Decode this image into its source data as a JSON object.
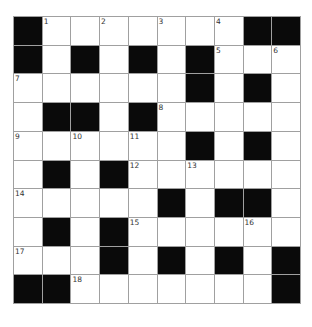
{
  "puzzle": {
    "rows": 10,
    "cols": 10,
    "colors": {
      "black": "#0a0a0a",
      "white": "#ffffff",
      "grid_line": "#a0a0a0",
      "number": "#333333"
    },
    "grid": [
      [
        "B",
        "1",
        ".",
        "2",
        ".",
        "3",
        ".",
        "4",
        "B",
        "B"
      ],
      [
        "B",
        ".",
        "B",
        ".",
        "B",
        ".",
        "B",
        "5",
        ".",
        "6"
      ],
      [
        "7",
        ".",
        ".",
        ".",
        ".",
        ".",
        "B",
        ".",
        "B",
        "."
      ],
      [
        ".",
        "B",
        "B",
        ".",
        "B",
        "8",
        ".",
        ".",
        ".",
        "."
      ],
      [
        "9",
        ".",
        "10",
        ".",
        "11",
        ".",
        "B",
        ".",
        "B",
        "."
      ],
      [
        ".",
        "B",
        ".",
        "B",
        "12",
        ".",
        "13",
        ".",
        ".",
        "."
      ],
      [
        "14",
        ".",
        ".",
        ".",
        ".",
        "B",
        ".",
        "B",
        "B",
        "."
      ],
      [
        ".",
        "B",
        ".",
        "B",
        "15",
        ".",
        ".",
        ".",
        "16",
        "."
      ],
      [
        "17",
        ".",
        ".",
        "B",
        ".",
        "B",
        ".",
        "B",
        ".",
        "B"
      ],
      [
        "B",
        "B",
        "18",
        ".",
        ".",
        ".",
        ".",
        ".",
        ".",
        "B"
      ]
    ]
  }
}
